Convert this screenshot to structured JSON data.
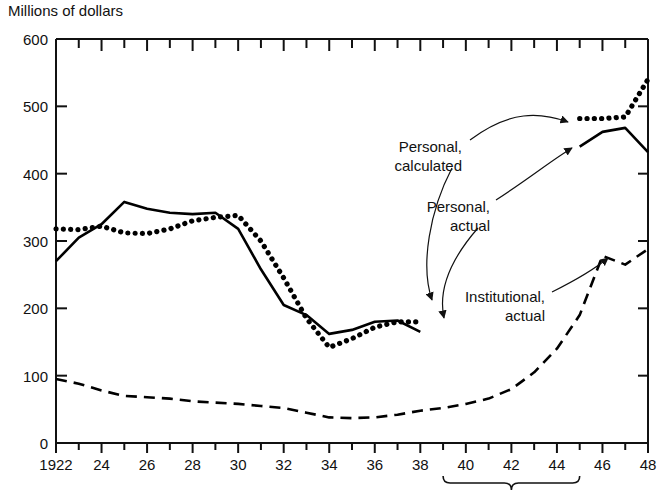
{
  "chart_data": {
    "type": "line",
    "title": "Millions of dollars",
    "xlabel": "",
    "ylabel": "Millions of dollars",
    "ylim": [
      0,
      600
    ],
    "xlim": [
      1922,
      1948
    ],
    "yticks": [
      0,
      100,
      200,
      300,
      400,
      500,
      600
    ],
    "ytick_labels": [
      "0",
      "100",
      "200",
      "300",
      "400",
      "500",
      "600"
    ],
    "xticks": [
      1922,
      1924,
      1926,
      1928,
      1930,
      1932,
      1934,
      1936,
      1938,
      1940,
      1942,
      1944,
      1946,
      1948
    ],
    "xtick_labels": [
      "1922",
      "24",
      "26",
      "28",
      "30",
      "32",
      "34",
      "36",
      "38",
      "40",
      "42",
      "44",
      "46",
      "48"
    ],
    "grid": false,
    "legend": "annotations-with-arrows",
    "minor_xticks_every": 1,
    "top_axis_ticks": true,
    "annotations": [
      {
        "text_line1": "Personal,",
        "text_line2": "calculated",
        "target_series": "Personal, calculated"
      },
      {
        "text_line1": "Personal,",
        "text_line2": "actual",
        "target_series": "Personal, actual"
      },
      {
        "text_line1": "Institutional,",
        "text_line2": "actual",
        "target_series": "Institutional, actual"
      },
      {
        "text_line1": "War period",
        "text_line2": "",
        "target_series": "x-axis bracket 1939-1945"
      }
    ],
    "war_period": {
      "label": "War period",
      "start": 1939,
      "end": 1945
    },
    "series": [
      {
        "name": "Personal, calculated",
        "style": "dotted",
        "color": "#000000",
        "x": [
          1922,
          1923,
          1924,
          1925,
          1926,
          1927,
          1928,
          1929,
          1930,
          1931,
          1932,
          1933,
          1934,
          1935,
          1936,
          1937,
          1938,
          1945,
          1946,
          1947,
          1948
        ],
        "values": [
          318,
          317,
          322,
          312,
          311,
          318,
          330,
          335,
          338,
          300,
          245,
          185,
          142,
          155,
          172,
          180,
          180,
          482,
          482,
          484,
          540
        ]
      },
      {
        "name": "Personal, actual",
        "style": "solid",
        "color": "#000000",
        "x": [
          1922,
          1923,
          1924,
          1925,
          1926,
          1927,
          1928,
          1929,
          1930,
          1931,
          1932,
          1933,
          1934,
          1935,
          1936,
          1937,
          1938,
          1945,
          1946,
          1947,
          1948
        ],
        "values": [
          270,
          305,
          325,
          358,
          348,
          342,
          340,
          342,
          318,
          258,
          205,
          190,
          162,
          168,
          180,
          182,
          165,
          440,
          462,
          468,
          432
        ]
      },
      {
        "name": "Institutional, actual",
        "style": "dashed",
        "color": "#000000",
        "x": [
          1922,
          1923,
          1924,
          1925,
          1926,
          1927,
          1928,
          1929,
          1930,
          1931,
          1932,
          1933,
          1934,
          1935,
          1936,
          1937,
          1938,
          1939,
          1940,
          1941,
          1942,
          1943,
          1944,
          1945,
          1946,
          1947,
          1948
        ],
        "values": [
          95,
          88,
          78,
          70,
          68,
          66,
          62,
          60,
          58,
          55,
          52,
          45,
          38,
          37,
          38,
          42,
          48,
          52,
          58,
          66,
          80,
          105,
          140,
          190,
          278,
          265,
          288
        ]
      }
    ]
  }
}
